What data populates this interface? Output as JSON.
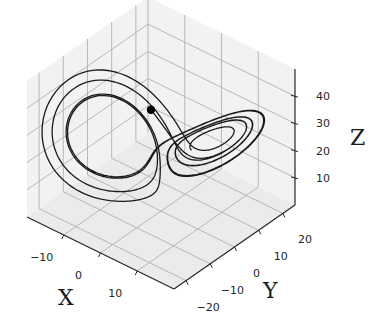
{
  "chart_data": {
    "type": "line3d",
    "title": "",
    "xlabel": "X",
    "ylabel": "Y",
    "zlabel": "Z",
    "xlim": [
      -20,
      20
    ],
    "ylim": [
      -25,
      25
    ],
    "zlim": [
      0,
      50
    ],
    "xticks": [
      -10,
      0,
      10
    ],
    "yticks": [
      -20,
      -10,
      0,
      10,
      20
    ],
    "zticks": [
      10,
      20,
      30,
      40
    ],
    "xtick_labels": [
      "−10",
      "0",
      "10"
    ],
    "ytick_labels": [
      "−20",
      "−10",
      "0",
      "10",
      "20"
    ],
    "ztick_labels": [
      "10",
      "20",
      "30",
      "40"
    ],
    "grid": true,
    "series": [
      {
        "name": "trajectory",
        "color": "#1a1a1a",
        "system": "lorenz",
        "params": {
          "sigma": 10,
          "rho": 28,
          "beta": 2.6667
        },
        "initial_state": [
          -8.0,
          8.0,
          27.0
        ],
        "dt": 0.005,
        "steps": 1700
      }
    ],
    "marker": {
      "name": "current-state",
      "x": -8.0,
      "y": 8.0,
      "z": 27.0,
      "color": "#000000"
    },
    "colors": {
      "pane": "#f2f2f2",
      "pane_floor": "#ebebeb",
      "grid": "#b0b0b0",
      "axis": "#262626",
      "line": "#1a1a1a"
    }
  }
}
